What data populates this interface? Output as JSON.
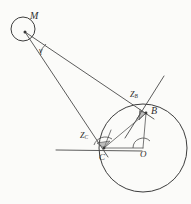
{
  "figure": {
    "kind": "geometry-diagram",
    "background_color": "#fbfbf9",
    "line_color": "#4a4a4a",
    "circle_color": "#3d3d3d",
    "wedge_fill": "#8d8d8d",
    "width": 191,
    "height": 204
  },
  "labels": {
    "m": "M",
    "gamma": "γ",
    "z_b_base": "Z",
    "z_b_sub": "B",
    "b": "B",
    "z_c_base": "Z",
    "z_c_sub": "C",
    "c": "C",
    "o": "O"
  },
  "points": {
    "m": {
      "name": "M",
      "x": 23,
      "y": 30
    },
    "b": {
      "name": "B",
      "x": 146,
      "y": 113
    },
    "c": {
      "name": "C",
      "x": 104,
      "y": 148
    },
    "o": {
      "name": "O",
      "x": 143,
      "y": 148
    }
  },
  "circles": [
    {
      "name": "small-circle-at-m",
      "cx": 23,
      "cy": 29,
      "r": 12
    },
    {
      "name": "main-circle-at-o",
      "cx": 143,
      "cy": 148,
      "r": 44
    }
  ],
  "segments": [
    {
      "name": "ray-m-to-b",
      "x1": 25,
      "y1": 32,
      "x2": 152,
      "y2": 118
    },
    {
      "name": "ray-m-to-c",
      "x1": 25,
      "y1": 32,
      "x2": 107,
      "y2": 155
    },
    {
      "name": "chord-b-to-c",
      "x1": 146,
      "y1": 113,
      "x2": 104,
      "y2": 148
    },
    {
      "name": "radius-o-to-b",
      "x1": 143,
      "y1": 148,
      "x2": 146,
      "y2": 113
    },
    {
      "name": "radius-o-to-c",
      "x1": 143,
      "y1": 148,
      "x2": 104,
      "y2": 148
    },
    {
      "name": "tangent-at-b",
      "x1": 124,
      "y1": 137,
      "x2": 163,
      "y2": 77
    },
    {
      "name": "tangent-at-c",
      "x1": 56,
      "y1": 150,
      "x2": 140,
      "y2": 151
    },
    {
      "name": "line-c-upward",
      "x1": 104,
      "y1": 148,
      "x2": 110,
      "y2": 131
    }
  ],
  "angle_markers": [
    {
      "name": "angle-gamma-at-m",
      "vertex": "M",
      "label": "γ"
    },
    {
      "name": "angle-z-b",
      "vertex": "B",
      "label": "Z_B"
    },
    {
      "name": "angle-z-c",
      "vertex": "C",
      "label": "Z_C"
    },
    {
      "name": "right-angle-at-o",
      "vertex": "O",
      "label": ""
    }
  ]
}
